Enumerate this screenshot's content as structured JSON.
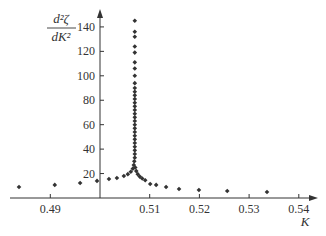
{
  "chart_data": {
    "type": "scatter",
    "title": "",
    "xlabel": "K",
    "ylabel": "d²ζ/dK²",
    "ylabel_parts": {
      "numerator": "d²ζ",
      "denominator": "dK²"
    },
    "xlim": [
      0.48,
      0.543
    ],
    "ylim": [
      0,
      150
    ],
    "x_axis_crosses_y_at": 0,
    "y_axis_at_x": 0.5,
    "grid": false,
    "legend": null,
    "x_ticks": [
      0.49,
      0.51,
      0.52,
      0.53,
      0.54
    ],
    "x_tick_labels": [
      "0.49",
      "0.51",
      "0.52",
      "0.53",
      "0.54"
    ],
    "y_ticks": [
      20,
      40,
      60,
      80,
      100,
      120,
      140
    ],
    "y_tick_labels": [
      "20",
      "40",
      "60",
      "80",
      "100",
      "120",
      "140"
    ],
    "marker": "diamond",
    "marker_color": "#333333",
    "series": [
      {
        "name": "d2zeta_dK2",
        "points": [
          [
            0.4837,
            9.0
          ],
          [
            0.4909,
            10.7
          ],
          [
            0.496,
            12.3
          ],
          [
            0.4994,
            14.0
          ],
          [
            0.5018,
            15.6
          ],
          [
            0.5034,
            16.4
          ],
          [
            0.5048,
            18.0
          ],
          [
            0.5056,
            19.5
          ],
          [
            0.5062,
            21.5
          ],
          [
            0.5066,
            24.0
          ],
          [
            0.5068,
            27.0
          ],
          [
            0.5069,
            30.0
          ],
          [
            0.507,
            33.0
          ],
          [
            0.507,
            36.0
          ],
          [
            0.507,
            39.0
          ],
          [
            0.507,
            42.0
          ],
          [
            0.507,
            45.0
          ],
          [
            0.507,
            48.0
          ],
          [
            0.507,
            51.0
          ],
          [
            0.507,
            54.0
          ],
          [
            0.507,
            57.0
          ],
          [
            0.507,
            60.0
          ],
          [
            0.507,
            63.0
          ],
          [
            0.507,
            66.0
          ],
          [
            0.507,
            69.0
          ],
          [
            0.507,
            72.0
          ],
          [
            0.507,
            75.0
          ],
          [
            0.507,
            78.0
          ],
          [
            0.507,
            81.0
          ],
          [
            0.507,
            84.0
          ],
          [
            0.507,
            87.0
          ],
          [
            0.507,
            90.0
          ],
          [
            0.507,
            94.0
          ],
          [
            0.507,
            100.0
          ],
          [
            0.507,
            106.0
          ],
          [
            0.507,
            111.0
          ],
          [
            0.507,
            119.0
          ],
          [
            0.507,
            124.0
          ],
          [
            0.507,
            132.0
          ],
          [
            0.507,
            136.0
          ],
          [
            0.507,
            145.0
          ],
          [
            0.5071,
            25.0
          ],
          [
            0.5073,
            22.0
          ],
          [
            0.5076,
            19.5
          ],
          [
            0.508,
            17.5
          ],
          [
            0.5085,
            16.0
          ],
          [
            0.5091,
            14.5
          ],
          [
            0.5101,
            11.5
          ],
          [
            0.5113,
            10.7
          ],
          [
            0.5133,
            9.0
          ],
          [
            0.5159,
            7.4
          ],
          [
            0.5199,
            6.6
          ],
          [
            0.5256,
            5.7
          ],
          [
            0.5336,
            4.9
          ]
        ]
      }
    ]
  }
}
